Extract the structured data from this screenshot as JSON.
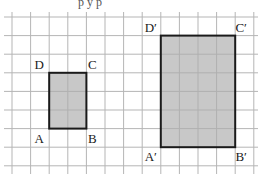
{
  "figure": {
    "grid": {
      "cell_size_px": 18.6,
      "origin_x": 12,
      "origin_y": 17,
      "columns": 13,
      "rows": 8,
      "line_color": "#b5b5b5",
      "extends_past_edges": true
    },
    "shape_style": {
      "fill": "#c8c8c8",
      "stroke": "#1a1a1a",
      "stroke_width": 2
    },
    "shapes": [
      {
        "name": "ABCD",
        "grid_rect": {
          "col": 2,
          "row": 3,
          "width": 2,
          "height": 3
        },
        "labels": {
          "A": "A",
          "B": "B",
          "C": "C",
          "D": "D"
        }
      },
      {
        "name": "A'B'C'D'",
        "grid_rect": {
          "col": 8,
          "row": 1,
          "width": 4,
          "height": 6
        },
        "labels": {
          "A": "A′",
          "B": "B′",
          "C": "C′",
          "D": "D′"
        }
      }
    ],
    "cropped_top_text": "p    y    p"
  }
}
